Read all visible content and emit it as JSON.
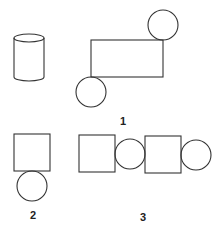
{
  "figures": [
    {
      "id": "cylinder",
      "label": "",
      "description": "cylinder"
    },
    {
      "id": "fig1",
      "label": "1",
      "description": "rectangle with circles at top-right and bottom-left corners"
    },
    {
      "id": "fig2",
      "label": "2",
      "description": "square with circle below"
    },
    {
      "id": "fig3",
      "label": "3",
      "description": "square, circle, square, circle in a row"
    }
  ],
  "colors": {
    "stroke": "#333333",
    "background": "#ffffff"
  }
}
